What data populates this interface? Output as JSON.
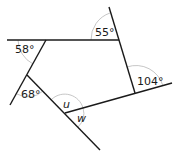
{
  "diagram": {
    "stroke_color": "#1a1a1a",
    "arc_color": "#b8b8b8",
    "lines": [
      {
        "id": "top-line",
        "x1": 7,
        "y1": 40,
        "x2": 119,
        "y2": 40
      },
      {
        "id": "upper-right-line",
        "x1": 109,
        "y1": 7,
        "x2": 135,
        "y2": 93
      },
      {
        "id": "bottom-right-line",
        "x1": 65,
        "y1": 113,
        "x2": 172,
        "y2": 83
      },
      {
        "id": "left-line",
        "x1": 46,
        "y1": 40,
        "x2": 10,
        "y2": 105
      },
      {
        "id": "diagonal-line",
        "x1": 27,
        "y1": 75,
        "x2": 100,
        "y2": 150
      }
    ],
    "angles": [
      {
        "id": "angle-58",
        "label": "58°",
        "x": 15,
        "y": 53,
        "kind": "value"
      },
      {
        "id": "angle-55",
        "label": "55°",
        "x": 95,
        "y": 36,
        "kind": "value"
      },
      {
        "id": "angle-104",
        "label": "104°",
        "x": 137,
        "y": 85,
        "kind": "value"
      },
      {
        "id": "angle-68",
        "label": "68°",
        "x": 21,
        "y": 98,
        "kind": "value"
      },
      {
        "id": "angle-u",
        "label": "u",
        "x": 63,
        "y": 108,
        "kind": "variable"
      },
      {
        "id": "angle-w",
        "label": "w",
        "x": 77,
        "y": 122,
        "kind": "variable"
      }
    ],
    "arcs": [
      {
        "id": "arc-58",
        "d": "M 18 40 A 28 28 0 0 0 33 64"
      },
      {
        "id": "arc-55",
        "d": "M 91 40 A 28 28 0 0 1 110 13"
      },
      {
        "id": "arc-104",
        "d": "M 127 67 A 28 28 0 0 1 163 86"
      },
      {
        "id": "arc-68",
        "d": "M 17 94 A 22 22 0 0 0 43 91"
      },
      {
        "id": "arc-u",
        "d": "M 52 99 A 19 19 0 0 1 83 108"
      },
      {
        "id": "arc-w",
        "d": "M 83 108 A 19 19 0 0 1 78 127"
      }
    ]
  }
}
